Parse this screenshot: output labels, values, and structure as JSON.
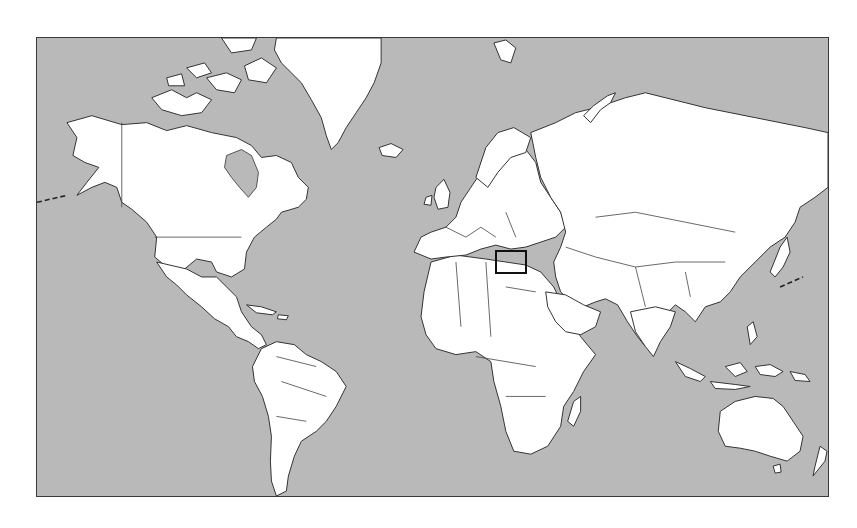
{
  "map": {
    "title": "",
    "projection": "mercator-world",
    "colors": {
      "ocean": "#b9b9b9",
      "land": "#ffffff",
      "outline": "#333333",
      "frame": "#3a3a3a",
      "highlight": "#111111"
    },
    "frame": {
      "x": 36,
      "y": 37,
      "width": 793,
      "height": 460
    },
    "highlight_region": {
      "label": "Eastern Mediterranean / Levant",
      "x": 495,
      "y": 250,
      "width": 32,
      "height": 24
    },
    "continents": [
      "North America",
      "Greenland",
      "South America",
      "Europe",
      "Africa",
      "Asia",
      "Australia",
      "New Zealand"
    ]
  }
}
